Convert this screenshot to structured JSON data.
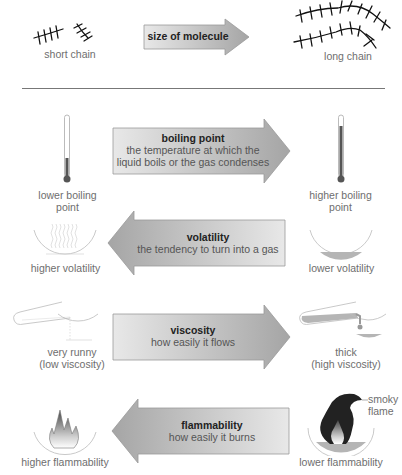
{
  "top_section": {
    "arrow": {
      "direction": "right",
      "title": "size of molecule"
    },
    "left_label": "short chain",
    "right_label": "long chain"
  },
  "rows": [
    {
      "id": "boiling-point",
      "arrow": {
        "direction": "right",
        "title": "boiling point",
        "description_line1": "the temperature at which the",
        "description_line2": "liquid boils or the gas condenses"
      },
      "left": {
        "icon": "thermometer-low-icon",
        "label_line1": "lower boiling",
        "label_line2": "point"
      },
      "right": {
        "icon": "thermometer-high-icon",
        "label_line1": "higher boiling",
        "label_line2": "point"
      }
    },
    {
      "id": "volatility",
      "arrow": {
        "direction": "left",
        "title": "volatility",
        "description_line1": "the tendency to turn into a gas"
      },
      "left": {
        "icon": "evaporating-dish-icon",
        "label_line1": "higher volatility"
      },
      "right": {
        "icon": "liquid-dish-icon",
        "label_line1": "lower volatility"
      }
    },
    {
      "id": "viscosity",
      "arrow": {
        "direction": "right",
        "title": "viscosity",
        "description_line1": "how easily it flows"
      },
      "left": {
        "icon": "runny-pour-icon",
        "label_line1": "very runny",
        "label_line2": "(low viscosity)"
      },
      "right": {
        "icon": "thick-pour-icon",
        "label_line1": "thick",
        "label_line2": "(high viscosity)"
      }
    },
    {
      "id": "flammability",
      "arrow": {
        "direction": "left",
        "title": "flammability",
        "description_line1": "how easily it burns"
      },
      "left": {
        "icon": "clean-flame-icon",
        "label_line1": "higher flammability"
      },
      "right": {
        "icon": "smoky-flame-icon",
        "label_line1": "lower flammability",
        "annotation_line1": "smoky",
        "annotation_line2": "flame"
      }
    }
  ],
  "colors": {
    "arrow_light": "#e6e6e6",
    "arrow_dark": "#a9a9a9",
    "label_text": "#6e6e6e",
    "title_text": "#222222",
    "liquid": "#b5b5b5",
    "thermo_fill": "#555555"
  }
}
